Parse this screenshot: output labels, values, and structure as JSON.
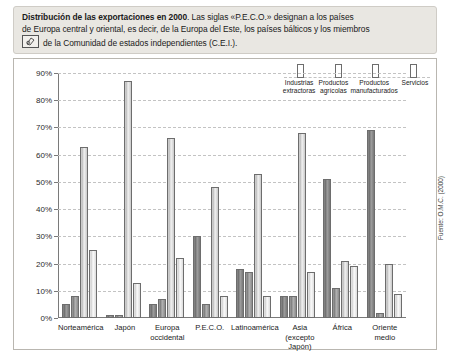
{
  "caption": {
    "bold_lead": "Distribución de las exportaciones en 2000",
    "rest_line1": ". Las siglas «P.E.C.O.» designan a los países",
    "line2": "de Europa central y oriental, es decir, de la Europa del Este, los países bálticos y los miembros",
    "line3": "de la Comunidad de estados independientes (C.E.I.)."
  },
  "source": "Fuente: O.M.C. (2000)",
  "chart_data": {
    "type": "bar",
    "title": "Distribución de las exportaciones en 2000",
    "xlabel": "",
    "ylabel": "",
    "ylim": [
      0,
      90
    ],
    "ytick_labels": [
      "0%",
      "10%",
      "20%",
      "30%",
      "40%",
      "50%",
      "60%",
      "70%",
      "80%",
      "90%"
    ],
    "ytick_values": [
      0,
      10,
      20,
      30,
      40,
      50,
      60,
      70,
      80,
      90
    ],
    "grid": true,
    "legend_position": "top-right",
    "categories": [
      "Norteamérica",
      "Japón",
      "Europa\noccidental",
      "P.E.C.O.",
      "Latinoamérica",
      "Asia\n(excepto Japón)",
      "África",
      "Oriente medio"
    ],
    "category_lines": [
      [
        "Norteamérica"
      ],
      [
        "Japón"
      ],
      [
        "Europa",
        "occidental"
      ],
      [
        "P.E.C.O."
      ],
      [
        "Latinoamérica"
      ],
      [
        "Asia",
        "(excepto Japón)"
      ],
      [
        "África"
      ],
      [
        "Oriente medio"
      ]
    ],
    "series": [
      {
        "name": "Industrias extractoras",
        "name_lines": [
          "Industrias",
          "extractoras"
        ],
        "values": [
          5,
          1,
          5,
          30,
          18,
          8,
          51,
          69
        ]
      },
      {
        "name": "Productos agrícolas",
        "name_lines": [
          "Productos",
          "agrícolas"
        ],
        "values": [
          8,
          1,
          7,
          5,
          17,
          8,
          11,
          2
        ]
      },
      {
        "name": "Productos manufacturados",
        "name_lines": [
          "Productos",
          "manufacturados"
        ],
        "values": [
          63,
          87,
          66,
          48,
          53,
          68,
          21,
          20
        ]
      },
      {
        "name": "Servicios",
        "name_lines": [
          "Servicios"
        ],
        "values": [
          25,
          13,
          22,
          8,
          8,
          17,
          19,
          9
        ]
      }
    ]
  }
}
